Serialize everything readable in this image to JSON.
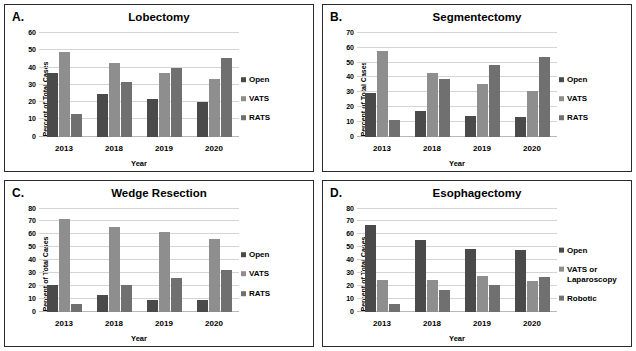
{
  "figure": {
    "axis_titles": {
      "y": "Percent of Total Cases",
      "x": "Year"
    },
    "colors": {
      "open": "#4a4a4a",
      "vats": "#8e8e8e",
      "rats": "#707070",
      "grid": "#d4d4d4",
      "border": "#2b2b2b"
    }
  },
  "panels": [
    {
      "letter": "A.",
      "title": "Lobectomy",
      "legend": [
        "Open",
        "VATS",
        "RATS"
      ],
      "chart_data": {
        "type": "bar",
        "title": "Lobectomy",
        "xlabel": "Year",
        "ylabel": "Percent of Total Cases",
        "ylim": [
          0,
          60
        ],
        "yticks": [
          0,
          10,
          20,
          30,
          40,
          50,
          60
        ],
        "grid": true,
        "legend_position": "right",
        "categories": [
          "2013",
          "2018",
          "2019",
          "2020"
        ],
        "series": [
          {
            "name": "Open",
            "values": [
              37,
              24.5,
              21.8,
              20
            ]
          },
          {
            "name": "VATS",
            "values": [
              49,
              42.5,
              37,
              33.5
            ]
          },
          {
            "name": "RATS",
            "values": [
              13.3,
              31.5,
              40,
              45.5
            ]
          }
        ]
      }
    },
    {
      "letter": "B.",
      "title": "Segmentectomy",
      "legend": [
        "Open",
        "VATS",
        "RATS"
      ],
      "chart_data": {
        "type": "bar",
        "title": "Segmentectomy",
        "xlabel": "Year",
        "ylabel": "Percent of Total Cases",
        "ylim": [
          0,
          70
        ],
        "yticks": [
          0,
          10,
          20,
          30,
          40,
          50,
          60,
          70
        ],
        "grid": true,
        "legend_position": "right",
        "categories": [
          "2013",
          "2018",
          "2019",
          "2020"
        ],
        "series": [
          {
            "name": "Open",
            "values": [
              29.5,
              17,
              14,
              13.5
            ]
          },
          {
            "name": "VATS",
            "values": [
              57.5,
              43,
              35.5,
              31
            ]
          },
          {
            "name": "RATS",
            "values": [
              11.5,
              39,
              48.5,
              53.5
            ]
          }
        ]
      }
    },
    {
      "letter": "C.",
      "title": "Wedge Resection",
      "legend": [
        "Open",
        "VATS",
        "RATS"
      ],
      "chart_data": {
        "type": "bar",
        "title": "Wedge Resection",
        "xlabel": "Year",
        "ylabel": "Percent of Total Cases",
        "ylim": [
          0,
          80
        ],
        "yticks": [
          0,
          10,
          20,
          30,
          40,
          50,
          60,
          70,
          80
        ],
        "grid": true,
        "legend_position": "right",
        "categories": [
          "2013",
          "2018",
          "2019",
          "2020"
        ],
        "series": [
          {
            "name": "Open",
            "values": [
              20.5,
              13.5,
              9.5,
              9.5
            ]
          },
          {
            "name": "VATS",
            "values": [
              72,
              65.5,
              62,
              56.5
            ]
          },
          {
            "name": "RATS",
            "values": [
              6.5,
              20.5,
              26.5,
              32.5
            ]
          }
        ]
      }
    },
    {
      "letter": "D.",
      "title": "Esophagectomy",
      "legend": [
        "Open",
        "VATS or Laparoscopy",
        "Robotic"
      ],
      "chart_data": {
        "type": "bar",
        "title": "Esophagectomy",
        "xlabel": "Year",
        "ylabel": "Percent of Total Cases",
        "ylim": [
          0,
          80
        ],
        "yticks": [
          0,
          10,
          20,
          30,
          40,
          50,
          60,
          70,
          80
        ],
        "grid": true,
        "legend_position": "right",
        "categories": [
          "2013",
          "2018",
          "2019",
          "2020"
        ],
        "series": [
          {
            "name": "Open",
            "values": [
              67.5,
              56,
              49,
              48
            ]
          },
          {
            "name": "VATS or Laparoscopy",
            "values": [
              24.5,
              25,
              28,
              24
            ]
          },
          {
            "name": "Robotic",
            "values": [
              6.5,
              17,
              21,
              27
            ]
          }
        ]
      }
    }
  ]
}
